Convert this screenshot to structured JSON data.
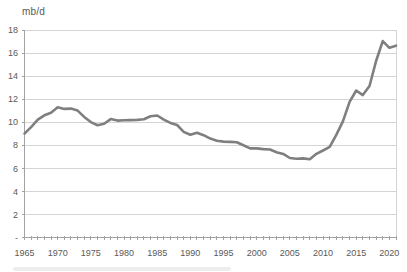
{
  "chart_data": {
    "type": "line",
    "title": "",
    "unit_label": "mb/d",
    "xlabel": "",
    "ylabel": "mb/d",
    "xlim": [
      1965,
      2021
    ],
    "ylim": [
      0,
      18
    ],
    "grid": "horizontal",
    "legend": "none",
    "colors": {
      "line": "#7f7f7f",
      "grid": "#d4d4d4",
      "axis": "#a3a3a3",
      "text": "#595959",
      "background": "#ffffff"
    },
    "yticks": [
      {
        "value": 18,
        "label": "18"
      },
      {
        "value": 16,
        "label": "16"
      },
      {
        "value": 14,
        "label": "14"
      },
      {
        "value": 12,
        "label": "12"
      },
      {
        "value": 10,
        "label": "10"
      },
      {
        "value": 8,
        "label": "8"
      },
      {
        "value": 6,
        "label": "6"
      },
      {
        "value": 4,
        "label": "4"
      },
      {
        "value": 2,
        "label": "2"
      },
      {
        "value": 0,
        "label": "-"
      }
    ],
    "xticks": [
      {
        "value": 1965,
        "label": "1965"
      },
      {
        "value": 1970,
        "label": "1970"
      },
      {
        "value": 1975,
        "label": "1975"
      },
      {
        "value": 1980,
        "label": "1980"
      },
      {
        "value": 1985,
        "label": "1985"
      },
      {
        "value": 1990,
        "label": "1990"
      },
      {
        "value": 1995,
        "label": "1995"
      },
      {
        "value": 2000,
        "label": "2000"
      },
      {
        "value": 2005,
        "label": "2005"
      },
      {
        "value": 2010,
        "label": "2010"
      },
      {
        "value": 2015,
        "label": "2015"
      },
      {
        "value": 2020,
        "label": "2020"
      }
    ],
    "x": [
      1965,
      1966,
      1967,
      1968,
      1969,
      1970,
      1971,
      1972,
      1973,
      1974,
      1975,
      1976,
      1977,
      1978,
      1979,
      1980,
      1981,
      1982,
      1983,
      1984,
      1985,
      1986,
      1987,
      1988,
      1989,
      1990,
      1991,
      1992,
      1993,
      1994,
      1995,
      1996,
      1997,
      1998,
      1999,
      2000,
      2001,
      2002,
      2003,
      2004,
      2005,
      2006,
      2007,
      2008,
      2009,
      2010,
      2011,
      2012,
      2013,
      2014,
      2015,
      2016,
      2017,
      2018,
      2019,
      2020,
      2021
    ],
    "values": [
      9.01,
      9.58,
      10.22,
      10.6,
      10.83,
      11.3,
      11.16,
      11.18,
      11.01,
      10.46,
      10.01,
      9.74,
      9.86,
      10.27,
      10.14,
      10.17,
      10.18,
      10.2,
      10.25,
      10.51,
      10.58,
      10.23,
      9.94,
      9.76,
      9.16,
      8.91,
      9.08,
      8.87,
      8.58,
      8.39,
      8.32,
      8.29,
      8.27,
      8.01,
      7.73,
      7.73,
      7.67,
      7.63,
      7.4,
      7.25,
      6.9,
      6.84,
      6.86,
      6.78,
      7.26,
      7.55,
      7.86,
      8.9,
      10.07,
      11.76,
      12.75,
      12.35,
      13.14,
      15.31,
      17.04,
      16.46,
      16.64
    ]
  }
}
